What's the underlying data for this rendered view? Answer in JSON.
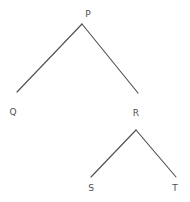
{
  "diagram": {
    "type": "tree",
    "title": "",
    "background_color": "#ffffff",
    "edge_color": "#4d4d4d",
    "edge_width": 1.1,
    "label_color": "#4d4d4d",
    "label_font_size": 9,
    "width": 190,
    "height": 202,
    "nodes": [
      {
        "id": "P",
        "label": "P",
        "label_x": 88,
        "label_y": 14,
        "point_x": 82,
        "point_y": 24,
        "depth": 0,
        "parent": null,
        "children": [
          "Q",
          "R"
        ]
      },
      {
        "id": "Q",
        "label": "Q",
        "label_x": 13,
        "label_y": 112,
        "point_x": 17,
        "point_y": 92,
        "depth": 1,
        "parent": "P",
        "children": []
      },
      {
        "id": "R",
        "label": "R",
        "label_x": 136,
        "label_y": 113,
        "point_x": 138,
        "point_y": 93,
        "depth": 1,
        "parent": "P",
        "children": [
          "S",
          "T"
        ]
      },
      {
        "id": "S",
        "label": "S",
        "label_x": 91,
        "label_y": 188,
        "point_x": 91,
        "point_y": 177,
        "depth": 2,
        "parent": "R",
        "children": []
      },
      {
        "id": "T",
        "label": "T",
        "label_x": 175,
        "label_y": 188,
        "point_x": 176,
        "point_y": 177,
        "depth": 2,
        "parent": "R",
        "children": []
      }
    ],
    "edges": [
      {
        "id": "edge-p-q",
        "from": "P",
        "to": "Q",
        "x1": 82,
        "y1": 24,
        "x2": 17,
        "y2": 92
      },
      {
        "id": "edge-p-r",
        "from": "P",
        "to": "R",
        "x1": 82,
        "y1": 24,
        "x2": 138,
        "y2": 93
      },
      {
        "id": "edge-r-s",
        "from": "R",
        "to": "S",
        "x1": 136,
        "y1": 130,
        "x2": 91,
        "y2": 177
      },
      {
        "id": "edge-r-t",
        "from": "R",
        "to": "T",
        "x1": 136,
        "y1": 130,
        "x2": 176,
        "y2": 177
      }
    ]
  }
}
